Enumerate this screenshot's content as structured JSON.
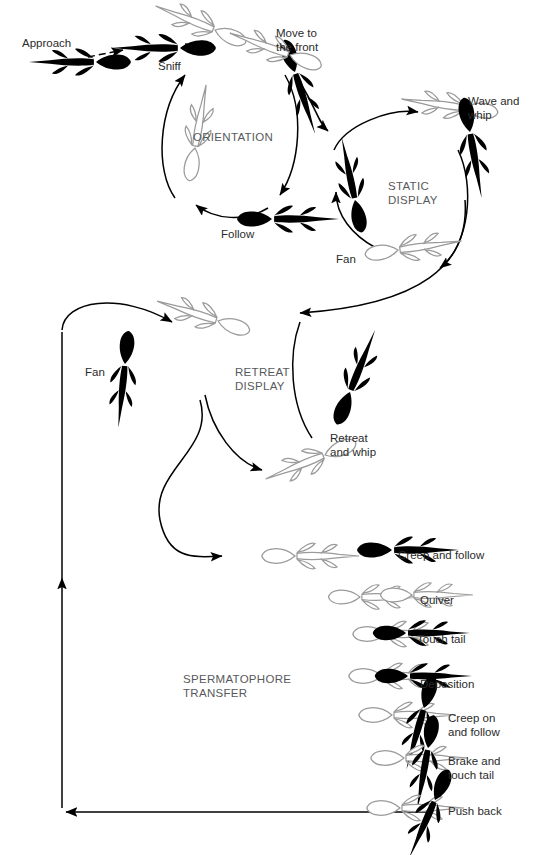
{
  "figure": {
    "colors": {
      "male": "#000000",
      "female_outline": "#9a9a9a",
      "label": "#2b2b2b",
      "phase_label": "#58595b",
      "background": "#ffffff"
    }
  },
  "phases": [
    {
      "id": "orientation",
      "label": "ORIENTATION",
      "x": 193,
      "y": 131
    },
    {
      "id": "static-display",
      "label": "STATIC\nDISPLAY",
      "x": 388,
      "y": 180
    },
    {
      "id": "retreat-display",
      "label": "RETREAT\nDISPLAY",
      "x": 235,
      "y": 366
    },
    {
      "id": "spermatophore-transfer",
      "label": "SPERMATOPHORE\nTRANSFER",
      "x": 183,
      "y": 673
    }
  ],
  "behaviours": [
    {
      "id": "approach",
      "label": "Approach",
      "x": 22,
      "y": 37
    },
    {
      "id": "sniff",
      "label": "Sniff",
      "x": 158,
      "y": 60
    },
    {
      "id": "move-to-the-front",
      "label": "Move to\nthe front",
      "x": 276,
      "y": 27
    },
    {
      "id": "wave-and-whip",
      "label": "Wave and\nwhip",
      "x": 468,
      "y": 95
    },
    {
      "id": "fan-static",
      "label": "Fan",
      "x": 336,
      "y": 253
    },
    {
      "id": "follow",
      "label": "Follow",
      "x": 221,
      "y": 228
    },
    {
      "id": "fan-retreat",
      "label": "Fan",
      "x": 85,
      "y": 366
    },
    {
      "id": "retreat-and-whip",
      "label": "Retreat\nand whip",
      "x": 330,
      "y": 432
    },
    {
      "id": "creep-and-follow",
      "label": "Creep and follow",
      "x": 398,
      "y": 549
    },
    {
      "id": "quiver",
      "label": "Quiver",
      "x": 420,
      "y": 594
    },
    {
      "id": "touch-tail",
      "label": "Touch tail",
      "x": 417,
      "y": 633
    },
    {
      "id": "deposition",
      "label": "Deposition",
      "x": 420,
      "y": 678
    },
    {
      "id": "creep-on-and-follow",
      "label": "Creep on\nand follow",
      "x": 448,
      "y": 712
    },
    {
      "id": "brake-and-touch-tail",
      "label": "Brake and\ntouch tail",
      "x": 448,
      "y": 755
    },
    {
      "id": "push-back",
      "label": "Push back",
      "x": 448,
      "y": 805
    }
  ],
  "transfer_sequence": [
    {
      "step": 1,
      "id": "creep-and-follow"
    },
    {
      "step": 2,
      "id": "quiver"
    },
    {
      "step": 3,
      "id": "touch-tail"
    },
    {
      "step": 4,
      "id": "deposition"
    },
    {
      "step": 5,
      "id": "creep-on-and-follow"
    },
    {
      "step": 6,
      "id": "brake-and-touch-tail"
    },
    {
      "step": 7,
      "id": "push-back"
    }
  ]
}
